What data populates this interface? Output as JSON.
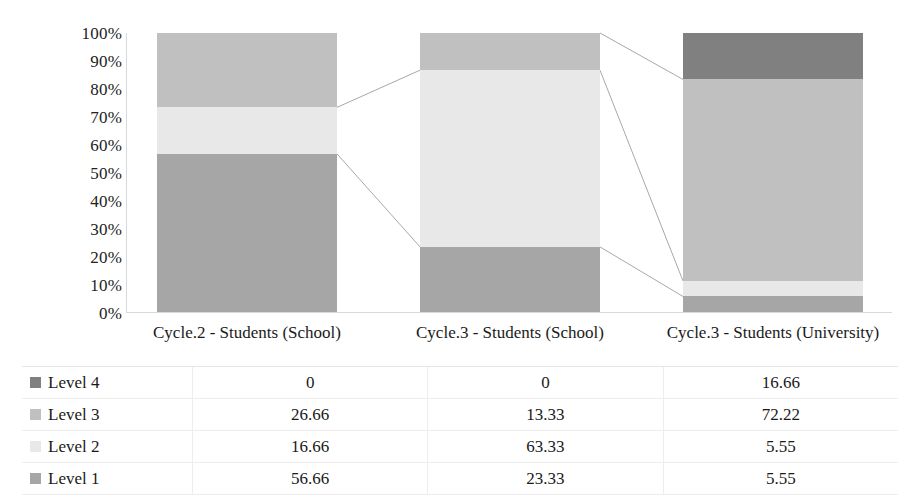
{
  "chart_data": {
    "type": "bar",
    "subtype": "stacked-100-percent-column",
    "title": "",
    "xlabel": "",
    "ylabel": "",
    "ylim": [
      0,
      100
    ],
    "grid": false,
    "legend_position": "data-table-left",
    "categories": [
      "Cycle.2 - Students (School)",
      "Cycle.3 - Students (School)",
      "Cycle.3 - Students (University)"
    ],
    "y_ticks": [
      "100%",
      "90%",
      "80%",
      "70%",
      "60%",
      "50%",
      "40%",
      "30%",
      "20%",
      "10%",
      "0%"
    ],
    "series": [
      {
        "name": "Level 4",
        "color": "#808080",
        "values": [
          0,
          0,
          16.66
        ]
      },
      {
        "name": "Level 3",
        "color": "#c0c0c0",
        "values": [
          26.66,
          13.33,
          72.22
        ]
      },
      {
        "name": "Level 2",
        "color": "#e8e8e8",
        "values": [
          16.66,
          63.33,
          5.55
        ]
      },
      {
        "name": "Level 1",
        "color": "#a6a6a6",
        "values": [
          56.66,
          23.33,
          5.55
        ]
      }
    ],
    "stack_order_top_to_bottom": [
      "Level 4",
      "Level 3",
      "Level 2",
      "Level 1"
    ],
    "series_lines": true,
    "series_line_color": "#a8a8a8"
  },
  "data_table": {
    "row_labels": [
      "Level 4",
      "Level 3",
      "Level 2",
      "Level 1"
    ],
    "columns": [
      "Cycle.2 - Students (School)",
      "Cycle.3 - Students (School)",
      "Cycle.3 - Students (University)"
    ],
    "rows": [
      {
        "label": "Level 4",
        "color": "#808080",
        "values": [
          "0",
          "0",
          "16.66"
        ]
      },
      {
        "label": "Level 3",
        "color": "#c0c0c0",
        "values": [
          "26.66",
          "13.33",
          "72.22"
        ]
      },
      {
        "label": "Level 2",
        "color": "#e8e8e8",
        "values": [
          "16.66",
          "63.33",
          "5.55"
        ]
      },
      {
        "label": "Level 1",
        "color": "#a6a6a6",
        "values": [
          "56.66",
          "23.33",
          "5.55"
        ]
      }
    ]
  }
}
